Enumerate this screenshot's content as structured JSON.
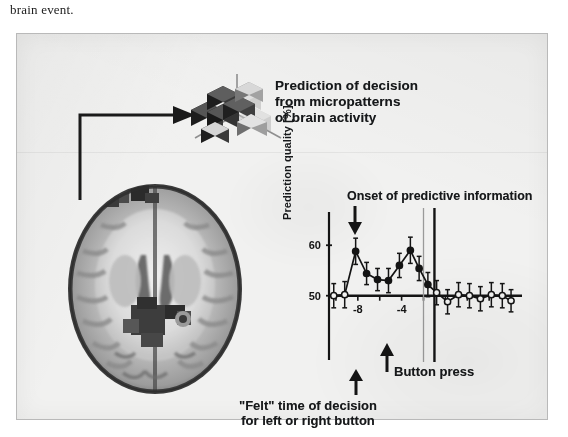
{
  "document": {
    "body_text": "brain event."
  },
  "figure": {
    "background_color": "#f1f1f0",
    "border_color": "#b9b9b9",
    "annotations": {
      "prediction_note": "Prediction of decision\nfrom micropatterns\nof brain activity",
      "prediction_note_lines": [
        "Prediction of decision",
        "from micropatterns",
        "of brain activity"
      ],
      "onset_note": "Onset of predictive information",
      "button_press_note": "Button press",
      "felt_note_lines": [
        "\"Felt\" time of decision",
        "for left or right button"
      ]
    },
    "icons": {
      "brain_slice": "axial-brain-mri-slice",
      "voxel_cube": "isometric-voxel-cluster",
      "connector_arrow": "elbow-arrow-right",
      "onset_arrow": "arrow-down",
      "button_press_arrow": "arrow-up",
      "felt_arrow": "arrow-up"
    }
  },
  "chart_data": {
    "type": "line",
    "title": "",
    "xlabel": "",
    "ylabel": "Prediction quality [%]",
    "xlim": [
      -11,
      7
    ],
    "ylim": [
      44,
      65
    ],
    "yticks": [
      50,
      60
    ],
    "ytick_labels": [
      "50",
      "60"
    ],
    "xticks": [
      -10,
      -8,
      -6,
      -4,
      -2,
      0,
      2,
      4,
      6
    ],
    "xtick_labels": [
      "",
      "-8",
      "",
      "-4",
      "",
      "",
      "",
      "",
      ""
    ],
    "grid": false,
    "legend": null,
    "chance_level": 50,
    "reference_lines": [
      {
        "name": "felt-time-of-decision",
        "x": -2,
        "style": "thin-gray"
      },
      {
        "name": "button-press",
        "x": -1,
        "style": "thick-black"
      }
    ],
    "onset_marker_x": -9.2,
    "series": [
      {
        "name": "prediction quality",
        "x": [
          -10.2,
          -9.2,
          -8.2,
          -7.2,
          -6.2,
          -5.2,
          -4.2,
          -3.2,
          -2.4,
          -1.6,
          -0.8,
          0.2,
          1.2,
          2.2,
          3.2,
          4.2,
          5.2,
          6.0
        ],
        "values": [
          50.0,
          50.2,
          58.8,
          54.4,
          53.2,
          53.0,
          56.0,
          59.0,
          55.4,
          52.2,
          50.6,
          48.8,
          50.2,
          50.0,
          49.4,
          50.2,
          50.0,
          49.0
        ],
        "errors": [
          2.4,
          2.6,
          2.6,
          2.2,
          2.2,
          2.4,
          2.4,
          2.6,
          2.4,
          2.4,
          2.4,
          2.4,
          2.4,
          2.4,
          2.4,
          2.4,
          2.4,
          2.2
        ],
        "marker_filled": [
          false,
          false,
          true,
          true,
          true,
          true,
          true,
          true,
          true,
          true,
          false,
          false,
          false,
          false,
          false,
          false,
          false,
          false
        ]
      }
    ]
  }
}
